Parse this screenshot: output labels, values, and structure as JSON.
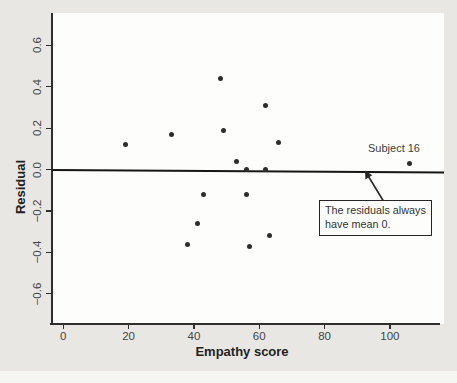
{
  "figure": {
    "background_color": "#e8e7e3",
    "plot_background": "#fdfdfc",
    "axis_color": "#2e2e2e",
    "text_color": "#454545"
  },
  "chart_data": {
    "type": "scatter",
    "title": "",
    "xlabel": "Empathy score",
    "ylabel": "Residual",
    "xlim": [
      -4,
      116
    ],
    "ylim": [
      -0.75,
      0.76
    ],
    "x_ticks": [
      0,
      20,
      40,
      60,
      80,
      100
    ],
    "y_ticks": [
      {
        "label": "0.6",
        "value": 0.6
      },
      {
        "label": "0.4",
        "value": 0.4
      },
      {
        "label": "0.2",
        "value": 0.2
      },
      {
        "label": "0.0",
        "value": 0.0
      },
      {
        "label": "−0.2",
        "value": -0.2
      },
      {
        "label": "−0.4",
        "value": -0.4
      },
      {
        "label": "−0.6",
        "value": -0.6
      }
    ],
    "grid": false,
    "zero_line_y": 0.0,
    "point_color": "#2d2d2d",
    "points": [
      [
        19,
        0.12
      ],
      [
        33,
        0.17
      ],
      [
        48,
        0.44
      ],
      [
        49,
        0.19
      ],
      [
        53,
        0.04
      ],
      [
        56,
        0.0
      ],
      [
        62,
        0.31
      ],
      [
        62,
        0.0
      ],
      [
        66,
        0.13
      ],
      [
        38,
        -0.36
      ],
      [
        41,
        -0.26
      ],
      [
        43,
        -0.12
      ],
      [
        56,
        -0.12
      ],
      [
        57,
        -0.37
      ],
      [
        63,
        -0.32
      ],
      [
        106,
        0.03
      ]
    ],
    "annotations": {
      "subject_label": "Subject 16",
      "subject_point": [
        106,
        0.03
      ],
      "callout_line1": "The residuals always",
      "callout_line2": "have mean 0.",
      "callout_target": "zero-residual-line"
    }
  }
}
